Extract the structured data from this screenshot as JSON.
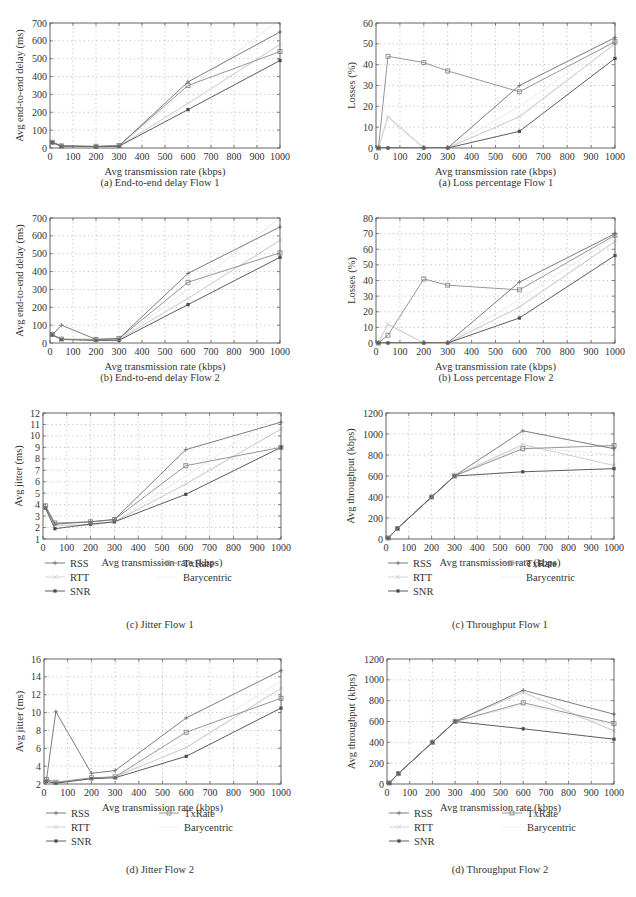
{
  "colors": {
    "RSS": "#6e6e6e",
    "RTT": "#cfcfcf",
    "SNR": "#4a4a4a",
    "TxRate": "#8a8a8a",
    "Barycentric": "#ededed",
    "axis": "#555555",
    "grid": "#9a9a9a",
    "text": "#333333"
  },
  "legend": {
    "items": [
      {
        "name": "RSS",
        "marker": "plus"
      },
      {
        "name": "RTT",
        "marker": "x"
      },
      {
        "name": "SNR",
        "marker": "star"
      },
      {
        "name": "TxRate",
        "marker": "square"
      },
      {
        "name": "Barycentric",
        "marker": "none"
      }
    ]
  },
  "chart_data": [
    {
      "id": "delay1",
      "type": "line",
      "caption": "(a)  End-to-end delay Flow 1",
      "xlabel": "Avg transmission rate (kbps)",
      "ylabel": "Avg end-to-end delay (ms)",
      "x": [
        10,
        50,
        200,
        300,
        600,
        1000
      ],
      "xlim": [
        0,
        1000
      ],
      "ylim": [
        0,
        700
      ],
      "xticks": [
        0,
        100,
        200,
        300,
        400,
        500,
        600,
        700,
        800,
        900,
        1000
      ],
      "yticks": [
        0,
        100,
        200,
        300,
        400,
        500,
        600,
        700
      ],
      "grid": true,
      "legend": false,
      "series": [
        {
          "name": "RSS",
          "values": [
            32,
            12,
            8,
            12,
            370,
            650
          ]
        },
        {
          "name": "RTT",
          "values": [
            30,
            10,
            8,
            10,
            250,
            580
          ]
        },
        {
          "name": "SNR",
          "values": [
            30,
            10,
            8,
            10,
            215,
            490
          ]
        },
        {
          "name": "TxRate",
          "values": [
            32,
            12,
            10,
            14,
            350,
            540
          ]
        },
        {
          "name": "Barycentric",
          "values": [
            30,
            10,
            8,
            10,
            330,
            720
          ]
        }
      ]
    },
    {
      "id": "loss1",
      "type": "line",
      "caption": "(a)  Loss percentage Flow 1",
      "xlabel": "Avg transmission rate (kbps)",
      "ylabel": "Losses (%)",
      "x": [
        10,
        50,
        200,
        300,
        600,
        1000
      ],
      "xlim": [
        0,
        1000
      ],
      "ylim": [
        0,
        60
      ],
      "xticks": [
        0,
        100,
        200,
        300,
        400,
        500,
        600,
        700,
        800,
        900,
        1000
      ],
      "yticks": [
        0,
        10,
        20,
        30,
        40,
        50,
        60
      ],
      "grid": true,
      "legend": false,
      "series": [
        {
          "name": "RSS",
          "values": [
            0,
            0,
            0,
            0,
            30,
            53
          ]
        },
        {
          "name": "RTT",
          "values": [
            0,
            15,
            0,
            0,
            15,
            50
          ]
        },
        {
          "name": "SNR",
          "values": [
            0,
            0,
            0,
            0,
            8,
            43
          ]
        },
        {
          "name": "TxRate",
          "values": [
            0,
            44,
            41,
            37,
            27,
            51
          ]
        },
        {
          "name": "Barycentric",
          "values": [
            0,
            0,
            0,
            0,
            20,
            52
          ]
        }
      ]
    },
    {
      "id": "delay2",
      "type": "line",
      "caption": "(b)  End-to-end delay Flow 2",
      "xlabel": "Avg transmission rate (kbps)",
      "ylabel": "Avg end-to-end delay (ms)",
      "x": [
        10,
        50,
        200,
        300,
        600,
        1000
      ],
      "xlim": [
        0,
        1000
      ],
      "ylim": [
        0,
        700
      ],
      "xticks": [
        0,
        100,
        200,
        300,
        400,
        500,
        600,
        700,
        800,
        900,
        1000
      ],
      "yticks": [
        0,
        100,
        200,
        300,
        400,
        500,
        600,
        700
      ],
      "grid": true,
      "legend": false,
      "series": [
        {
          "name": "RSS",
          "values": [
            45,
            100,
            20,
            25,
            390,
            650
          ]
        },
        {
          "name": "RTT",
          "values": [
            45,
            20,
            15,
            20,
            250,
            575
          ]
        },
        {
          "name": "SNR",
          "values": [
            45,
            20,
            15,
            15,
            215,
            480
          ]
        },
        {
          "name": "TxRate",
          "values": [
            48,
            22,
            20,
            25,
            340,
            505
          ]
        },
        {
          "name": "Barycentric",
          "values": [
            45,
            20,
            15,
            20,
            300,
            700
          ]
        }
      ]
    },
    {
      "id": "loss2",
      "type": "line",
      "caption": "(b)  Loss percentage Flow 2",
      "xlabel": "Avg transmission rate (kbps)",
      "ylabel": "Losses (%)",
      "x": [
        10,
        50,
        200,
        300,
        600,
        1000
      ],
      "xlim": [
        0,
        1000
      ],
      "ylim": [
        0,
        80
      ],
      "xticks": [
        0,
        100,
        200,
        300,
        400,
        500,
        600,
        700,
        800,
        900,
        1000
      ],
      "yticks": [
        0,
        10,
        20,
        30,
        40,
        50,
        60,
        70,
        80
      ],
      "grid": true,
      "legend": false,
      "series": [
        {
          "name": "RSS",
          "values": [
            0,
            0,
            0,
            0,
            39,
            70
          ]
        },
        {
          "name": "RTT",
          "values": [
            0,
            12,
            0,
            0,
            23,
            65
          ]
        },
        {
          "name": "SNR",
          "values": [
            0,
            0,
            0,
            0,
            16,
            56
          ]
        },
        {
          "name": "TxRate",
          "values": [
            0,
            5,
            41,
            37,
            34,
            69
          ]
        },
        {
          "name": "Barycentric",
          "values": [
            0,
            0,
            0,
            0,
            28,
            68
          ]
        }
      ]
    },
    {
      "id": "jitter1",
      "type": "line",
      "caption": "(c)  Jitter Flow 1",
      "xlabel": "Avg transmission rate (kbps)",
      "ylabel": "Avg jitter (ms)",
      "x": [
        10,
        50,
        200,
        300,
        600,
        1000
      ],
      "xlim": [
        0,
        1000
      ],
      "ylim": [
        1,
        12
      ],
      "xticks": [
        0,
        100,
        200,
        300,
        400,
        500,
        600,
        700,
        800,
        900,
        1000
      ],
      "yticks": [
        1,
        2,
        3,
        4,
        5,
        6,
        7,
        8,
        9,
        10,
        11,
        12
      ],
      "grid": true,
      "legend": true,
      "series": [
        {
          "name": "RSS",
          "values": [
            3.8,
            2.3,
            2.5,
            2.7,
            8.8,
            11.2
          ]
        },
        {
          "name": "RTT",
          "values": [
            3.7,
            2.2,
            2.2,
            2.5,
            5.8,
            10.6
          ]
        },
        {
          "name": "SNR",
          "values": [
            3.7,
            1.9,
            2.3,
            2.5,
            4.9,
            9.0
          ]
        },
        {
          "name": "TxRate",
          "values": [
            3.9,
            2.4,
            2.5,
            2.7,
            7.4,
            9.0
          ]
        },
        {
          "name": "Barycentric",
          "values": [
            3.7,
            2.2,
            2.3,
            2.5,
            6.5,
            12.0
          ]
        }
      ]
    },
    {
      "id": "throughput1",
      "type": "line",
      "caption": "(c)  Throughput Flow 1",
      "xlabel": "Avg transmission rate (kbps)",
      "ylabel": "Avg throughput (kbps)",
      "x": [
        10,
        50,
        200,
        300,
        600,
        1000
      ],
      "xlim": [
        0,
        1000
      ],
      "ylim": [
        0,
        1200
      ],
      "xticks": [
        0,
        100,
        200,
        300,
        400,
        500,
        600,
        700,
        800,
        900,
        1000
      ],
      "yticks": [
        0,
        200,
        400,
        600,
        800,
        1000,
        1200
      ],
      "grid": true,
      "legend": true,
      "series": [
        {
          "name": "RSS",
          "values": [
            10,
            100,
            400,
            600,
            1030,
            860
          ]
        },
        {
          "name": "RTT",
          "values": [
            10,
            100,
            400,
            600,
            900,
            700
          ]
        },
        {
          "name": "SNR",
          "values": [
            10,
            100,
            400,
            600,
            640,
            670
          ]
        },
        {
          "name": "TxRate",
          "values": [
            10,
            100,
            400,
            600,
            860,
            890
          ]
        },
        {
          "name": "Barycentric",
          "values": [
            10,
            100,
            400,
            600,
            880,
            800
          ]
        }
      ]
    },
    {
      "id": "jitter2",
      "type": "line",
      "caption": "(d)  Jitter Flow 2",
      "xlabel": "Avg transmission rate (kbps)",
      "ylabel": "Avg jitter (ms)",
      "x": [
        10,
        50,
        200,
        300,
        600,
        1000
      ],
      "xlim": [
        0,
        1000
      ],
      "ylim": [
        2,
        16
      ],
      "xticks": [
        0,
        100,
        200,
        300,
        400,
        500,
        600,
        700,
        800,
        900,
        1000
      ],
      "yticks": [
        2,
        4,
        6,
        8,
        10,
        12,
        14,
        16
      ],
      "grid": true,
      "legend": true,
      "series": [
        {
          "name": "RSS",
          "values": [
            2.4,
            10.1,
            3.2,
            3.5,
            9.4,
            14.7
          ]
        },
        {
          "name": "RTT",
          "values": [
            2.3,
            2.1,
            2.6,
            2.8,
            6.1,
            12.7
          ]
        },
        {
          "name": "SNR",
          "values": [
            2.3,
            2.1,
            2.6,
            2.7,
            5.1,
            10.5
          ]
        },
        {
          "name": "TxRate",
          "values": [
            2.5,
            2.2,
            2.7,
            2.8,
            7.8,
            11.6
          ]
        },
        {
          "name": "Barycentric",
          "values": [
            2.3,
            2.1,
            2.6,
            2.8,
            7.0,
            13.5
          ]
        }
      ]
    },
    {
      "id": "throughput2",
      "type": "line",
      "caption": "(d)  Throughput Flow 2",
      "xlabel": "Avg transmission rate (kbps)",
      "ylabel": "Avg throughput (kbps)",
      "x": [
        10,
        50,
        200,
        300,
        600,
        1000
      ],
      "xlim": [
        0,
        1000
      ],
      "ylim": [
        0,
        1200
      ],
      "xticks": [
        0,
        100,
        200,
        300,
        400,
        500,
        600,
        700,
        800,
        900,
        1000
      ],
      "yticks": [
        0,
        200,
        400,
        600,
        800,
        1000,
        1200
      ],
      "grid": true,
      "legend": true,
      "series": [
        {
          "name": "RSS",
          "values": [
            10,
            100,
            400,
            600,
            900,
            670
          ]
        },
        {
          "name": "RTT",
          "values": [
            10,
            100,
            400,
            600,
            880,
            510
          ]
        },
        {
          "name": "SNR",
          "values": [
            10,
            100,
            400,
            600,
            530,
            430
          ]
        },
        {
          "name": "TxRate",
          "values": [
            10,
            100,
            400,
            600,
            780,
            580
          ]
        },
        {
          "name": "Barycentric",
          "values": [
            10,
            100,
            400,
            600,
            760,
            560
          ]
        }
      ]
    }
  ],
  "layout": [
    {
      "chart": 0,
      "plot": [
        50,
        23,
        280,
        148
      ],
      "caption_y": 186,
      "caption_cx": 160
    },
    {
      "chart": 1,
      "plot": [
        376,
        23,
        615,
        148
      ],
      "caption_y": 186,
      "caption_cx": 496
    },
    {
      "chart": 2,
      "plot": [
        50,
        218,
        280,
        343
      ],
      "caption_y": 381,
      "caption_cx": 160
    },
    {
      "chart": 3,
      "plot": [
        376,
        218,
        615,
        343
      ],
      "caption_y": 381,
      "caption_cx": 496
    },
    {
      "chart": 4,
      "plot": [
        43,
        413,
        281,
        539
      ],
      "caption_y": 628,
      "caption_cx": 160,
      "legend_y": 582
    },
    {
      "chart": 5,
      "plot": [
        386,
        413,
        614,
        539
      ],
      "caption_y": 628,
      "caption_cx": 500,
      "legend_y": 582
    },
    {
      "chart": 6,
      "plot": [
        44,
        659,
        281,
        784
      ],
      "caption_y": 873,
      "caption_cx": 160,
      "legend_y": 832
    },
    {
      "chart": 7,
      "plot": [
        387,
        659,
        614,
        784
      ],
      "caption_y": 873,
      "caption_cx": 500,
      "legend_y": 832
    }
  ]
}
